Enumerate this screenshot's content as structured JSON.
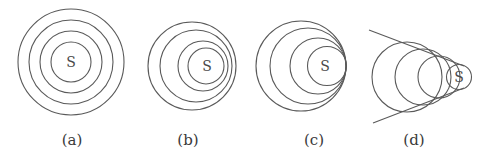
{
  "figure": {
    "stroke_color": "#5a5a5a",
    "text_color": "#3a3a3a",
    "panels": [
      {
        "id": "a",
        "label": "(a)",
        "source_label": "S",
        "source": {
          "x": 71,
          "y": 62
        },
        "label_pos": {
          "x": 72,
          "y": 140
        },
        "circles": [
          {
            "cx": 71,
            "cy": 62,
            "r": 53
          },
          {
            "cx": 71,
            "cy": 62,
            "r": 42
          },
          {
            "cx": 71,
            "cy": 62,
            "r": 31
          },
          {
            "cx": 71,
            "cy": 62,
            "r": 20
          }
        ],
        "lines": []
      },
      {
        "id": "b",
        "label": "(b)",
        "source_label": "S",
        "source": {
          "x": 207,
          "y": 66
        },
        "label_pos": {
          "x": 188,
          "y": 140
        },
        "circles": [
          {
            "cx": 192,
            "cy": 66,
            "r": 44
          },
          {
            "cx": 196,
            "cy": 66,
            "r": 36
          },
          {
            "cx": 203,
            "cy": 66,
            "r": 25
          },
          {
            "cx": 206,
            "cy": 66,
            "r": 18
          }
        ],
        "lines": []
      },
      {
        "id": "c",
        "label": "(c)",
        "source_label": "S",
        "source": {
          "x": 325,
          "y": 66
        },
        "label_pos": {
          "x": 314,
          "y": 140
        },
        "circles": [
          {
            "cx": 301,
            "cy": 66,
            "r": 45
          },
          {
            "cx": 308,
            "cy": 66,
            "r": 38
          },
          {
            "cx": 318,
            "cy": 66,
            "r": 28
          },
          {
            "cx": 327,
            "cy": 66,
            "r": 19.5
          }
        ],
        "lines": []
      },
      {
        "id": "d",
        "label": "(d)",
        "source_label": "S",
        "source": {
          "x": 459,
          "y": 77
        },
        "label_pos": {
          "x": 414,
          "y": 140
        },
        "circles": [
          {
            "cx": 407,
            "cy": 77,
            "r": 35
          },
          {
            "cx": 423,
            "cy": 77,
            "r": 28
          },
          {
            "cx": 439,
            "cy": 77,
            "r": 21
          },
          {
            "cx": 459,
            "cy": 77,
            "r": 12.5
          }
        ],
        "lines": [
          {
            "x1": 369,
            "y1": 30,
            "x2": 464,
            "y2": 66
          },
          {
            "x1": 373,
            "y1": 123,
            "x2": 464,
            "y2": 88
          }
        ]
      }
    ]
  }
}
